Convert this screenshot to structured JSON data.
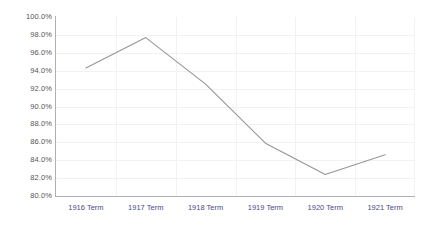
{
  "chart_data": {
    "type": "line",
    "title": "",
    "subtitle": "",
    "xlabel": "",
    "ylabel": "",
    "categories": [
      "1916 Term",
      "1917 Term",
      "1918 Term",
      "1919 Term",
      "1920 Term",
      "1921 Term"
    ],
    "series": [
      {
        "name": "",
        "values": [
          94.3,
          97.7,
          92.5,
          85.9,
          82.4,
          84.6
        ]
      }
    ],
    "ylim": [
      80.0,
      100.0
    ],
    "ytick_values": [
      100.0,
      98.0,
      96.0,
      94.0,
      92.0,
      90.0,
      88.0,
      86.0,
      84.0,
      82.0,
      80.0
    ],
    "ytick_labels": [
      "100.0%",
      "98.0%",
      "96.0%",
      "94.0%",
      "92.0%",
      "90.0%",
      "88.0%",
      "86.0%",
      "84.0%",
      "82.0%",
      "80.0%"
    ],
    "grid": true,
    "legend": false,
    "legend_position": "none",
    "colors": {
      "line": "#969696",
      "grid": "#f2f2f2",
      "axis": "#b0b0b0",
      "ytick_label": "#555555",
      "xtick_label": "#4a4a8a",
      "background": "#ffffff"
    }
  }
}
